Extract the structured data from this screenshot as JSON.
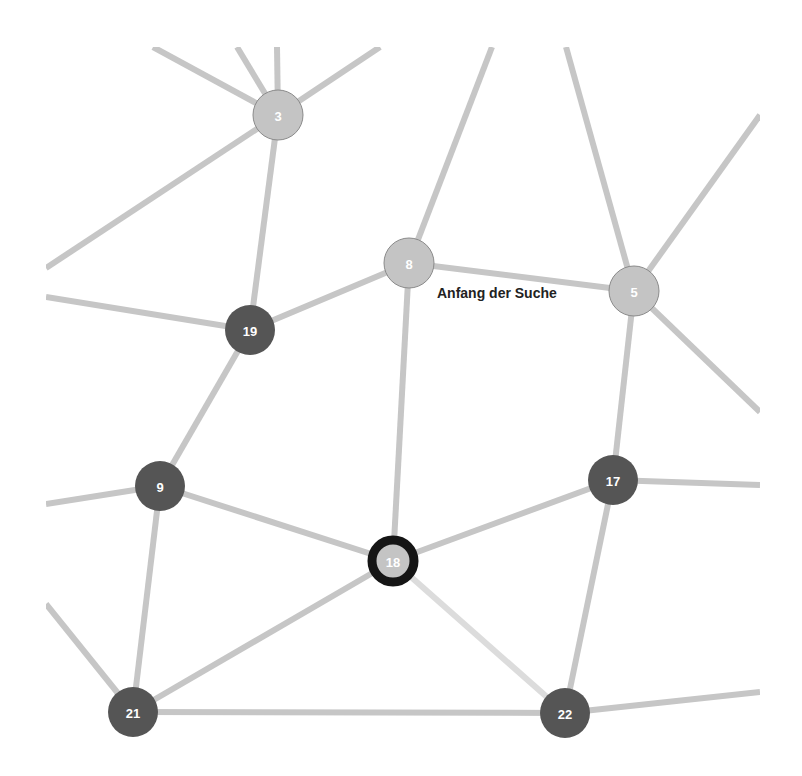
{
  "diagram": {
    "annotation": {
      "text": "Anfang der Suche",
      "x": 437,
      "y": 298
    },
    "colors": {
      "edge": "#c6c6c6",
      "edge_light": "#dcdcdc",
      "node_light": "#c4c4c4",
      "node_dark": "#555555",
      "current_ring": "#151515",
      "label": "#ffffff"
    },
    "nodes": [
      {
        "id": "3",
        "x": 278,
        "y": 115,
        "style": "light"
      },
      {
        "id": "8",
        "x": 409,
        "y": 263,
        "style": "light"
      },
      {
        "id": "5",
        "x": 634,
        "y": 291,
        "style": "light"
      },
      {
        "id": "19",
        "x": 250,
        "y": 330,
        "style": "dark"
      },
      {
        "id": "9",
        "x": 160,
        "y": 486,
        "style": "dark"
      },
      {
        "id": "17",
        "x": 613,
        "y": 480,
        "style": "dark"
      },
      {
        "id": "18",
        "x": 393,
        "y": 561,
        "style": "current"
      },
      {
        "id": "21",
        "x": 133,
        "y": 712,
        "style": "dark"
      },
      {
        "id": "22",
        "x": 565,
        "y": 713,
        "style": "dark"
      }
    ],
    "edges": [
      {
        "from": "3",
        "to": "19"
      },
      {
        "from": "19",
        "to": "8"
      },
      {
        "from": "8",
        "to": "5"
      },
      {
        "from": "8",
        "to": "18"
      },
      {
        "from": "19",
        "to": "9"
      },
      {
        "from": "9",
        "to": "18"
      },
      {
        "from": "9",
        "to": "21"
      },
      {
        "from": "18",
        "to": "17"
      },
      {
        "from": "18",
        "to": "21"
      },
      {
        "from": "18",
        "to": "22",
        "style": "light"
      },
      {
        "from": "5",
        "to": "17"
      },
      {
        "from": "17",
        "to": "22"
      },
      {
        "from": "21",
        "to": "22"
      }
    ],
    "offscreen_edges": [
      {
        "from": "3",
        "x": 153,
        "y": 47
      },
      {
        "from": "3",
        "x": 237,
        "y": 47
      },
      {
        "from": "3",
        "x": 277,
        "y": 47
      },
      {
        "from": "3",
        "x": 380,
        "y": 47
      },
      {
        "from": "3",
        "x": 46,
        "y": 268
      },
      {
        "from": "19",
        "x": 46,
        "y": 297
      },
      {
        "from": "8",
        "x": 492,
        "y": 47
      },
      {
        "from": "5",
        "x": 566,
        "y": 47
      },
      {
        "from": "5",
        "x": 760,
        "y": 115
      },
      {
        "from": "5",
        "x": 760,
        "y": 412
      },
      {
        "from": "9",
        "x": 46,
        "y": 504
      },
      {
        "from": "21",
        "x": 46,
        "y": 604
      },
      {
        "from": "17",
        "x": 760,
        "y": 485
      },
      {
        "from": "22",
        "x": 760,
        "y": 692
      }
    ]
  }
}
